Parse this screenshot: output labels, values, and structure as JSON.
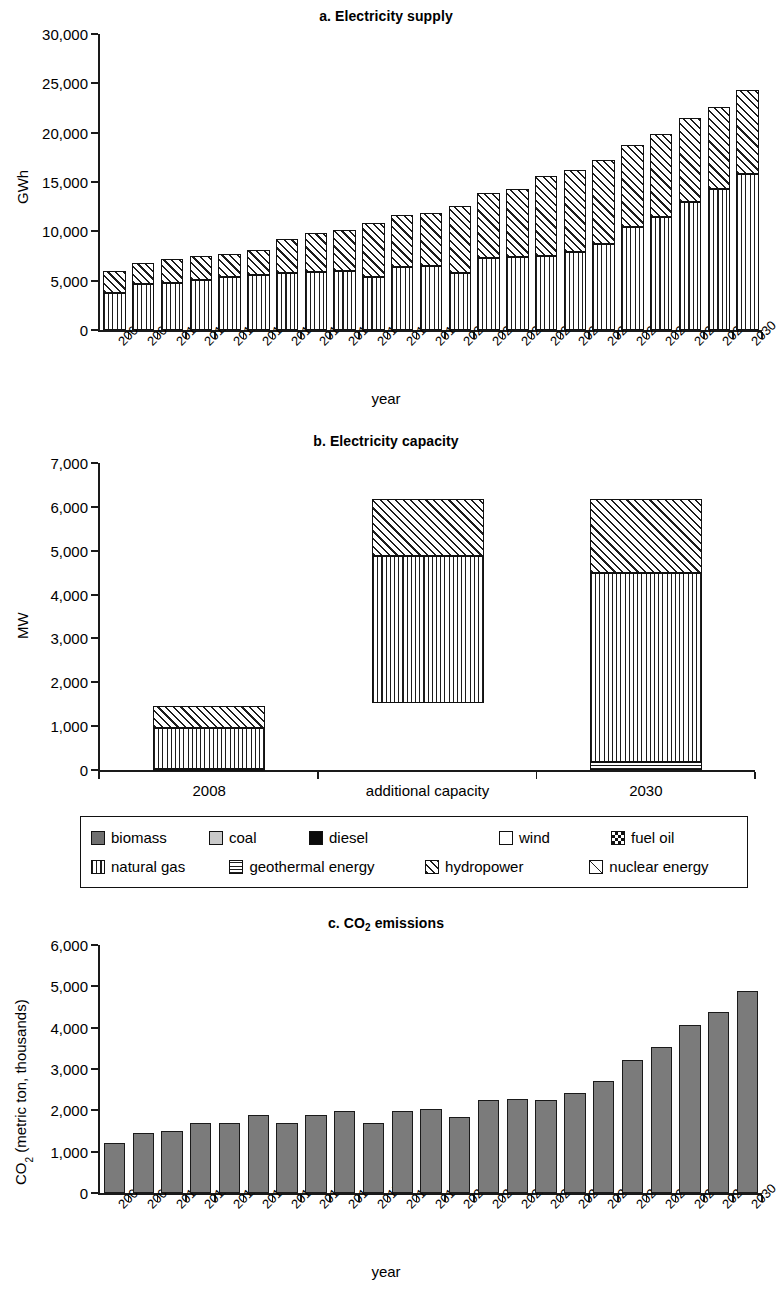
{
  "figure": {
    "axis_x_title": "year",
    "panels": [
      "a. Electricity supply",
      "b. Electricity capacity",
      "c. CO2 emissions"
    ]
  },
  "legend": {
    "rows": [
      [
        {
          "label": "biomass",
          "pattern": "p-biomass",
          "icon": "biomass-swatch"
        },
        {
          "label": "coal",
          "pattern": "p-coal",
          "icon": "coal-swatch"
        },
        {
          "label": "diesel",
          "pattern": "p-diesel",
          "icon": "diesel-swatch"
        },
        {
          "label": "wind",
          "pattern": "p-wind",
          "icon": "wind-swatch"
        },
        {
          "label": "fuel oil",
          "pattern": "p-fueloil",
          "icon": "fuel-oil-swatch"
        }
      ],
      [
        {
          "label": "natural gas",
          "pattern": "p-gas",
          "icon": "natural-gas-swatch"
        },
        {
          "label": "geothermal energy",
          "pattern": "p-geo",
          "icon": "geothermal-energy-swatch"
        },
        {
          "label": "hydropower",
          "pattern": "p-hydro",
          "icon": "hydropower-swatch"
        },
        {
          "label": "nuclear energy",
          "pattern": "p-nuclear",
          "icon": "nuclear-energy-swatch"
        }
      ]
    ]
  },
  "chart_data": [
    {
      "type": "bar",
      "id": "a",
      "title": "a. Electricity supply",
      "stacked": true,
      "xlabel": "year",
      "ylabel": "GWh",
      "ylim": [
        0,
        30000
      ],
      "yticks": [
        0,
        5000,
        10000,
        15000,
        20000,
        25000,
        30000
      ],
      "ytick_labels": [
        "0",
        "5,000",
        "10,000",
        "15,000",
        "20,000",
        "25,000",
        "30,000"
      ],
      "grid": false,
      "legend_position": "below-panel-b",
      "categories": [
        "2008",
        "2009",
        "2010",
        "2011",
        "2012",
        "2013",
        "2014",
        "2015",
        "2016",
        "2017",
        "2018",
        "2019",
        "2020",
        "2021",
        "2022",
        "2023",
        "2024",
        "2025",
        "2026",
        "2027",
        "2028",
        "2029",
        "2030"
      ],
      "series": [
        {
          "name": "natural gas",
          "pattern": "p-gas",
          "values": [
            3700,
            4700,
            4800,
            5100,
            5400,
            5600,
            5800,
            5900,
            6000,
            5400,
            6400,
            6500,
            5800,
            7300,
            7400,
            7500,
            7900,
            8700,
            10400,
            11500,
            13000,
            14300,
            15800
          ]
        },
        {
          "name": "hydropower",
          "pattern": "p-hydro",
          "values": [
            2250,
            2100,
            2350,
            2350,
            2350,
            2550,
            3400,
            3900,
            4150,
            5450,
            5300,
            5400,
            6800,
            6600,
            6900,
            8100,
            8300,
            8500,
            8400,
            8400,
            8500,
            8300,
            8500
          ]
        }
      ],
      "totals": [
        5950,
        6800,
        7150,
        7450,
        7750,
        8150,
        9200,
        9800,
        10150,
        10850,
        11700,
        11900,
        12600,
        13900,
        14300,
        15600,
        16200,
        17200,
        18800,
        19900,
        21500,
        22600,
        24300
      ]
    },
    {
      "type": "bar",
      "id": "b",
      "title": "b. Electricity capacity",
      "stacked": true,
      "xlabel": "",
      "ylabel": "MW",
      "ylim": [
        0,
        7000
      ],
      "yticks": [
        0,
        1000,
        2000,
        3000,
        4000,
        5000,
        6000,
        7000
      ],
      "ytick_labels": [
        "0",
        "1,000",
        "2,000",
        "3,000",
        "4,000",
        "5,000",
        "6,000",
        "7,000"
      ],
      "grid": false,
      "categories": [
        "2008",
        "additional capacity",
        "2030"
      ],
      "series": [
        {
          "name": "geothermal energy",
          "pattern": "p-geo",
          "values": [
            30,
            0,
            175
          ]
        },
        {
          "name": "natural gas",
          "pattern": "p-gas",
          "values": [
            920,
            3350,
            4320
          ]
        },
        {
          "name": "hydropower",
          "pattern": "p-hydro",
          "values": [
            500,
            1300,
            1695
          ]
        }
      ],
      "bar_bases": [
        0,
        1520,
        0
      ],
      "totals": [
        1450,
        6170,
        6190
      ]
    },
    {
      "type": "bar",
      "id": "c",
      "title": "c. CO2 emissions",
      "stacked": false,
      "xlabel": "year",
      "ylabel": "CO2 (metric ton, thousands)",
      "ylim": [
        0,
        6000
      ],
      "yticks": [
        0,
        1000,
        2000,
        3000,
        4000,
        5000,
        6000
      ],
      "ytick_labels": [
        "0",
        "1,000",
        "2,000",
        "3,000",
        "4,000",
        "5,000",
        "6,000"
      ],
      "grid": false,
      "bar_color": "#7b7b7b",
      "categories": [
        "2008",
        "2009",
        "2010",
        "2011",
        "2012",
        "2013",
        "2014",
        "2015",
        "2016",
        "2017",
        "2018",
        "2019",
        "2020",
        "2021",
        "2022",
        "2023",
        "2024",
        "2025",
        "2026",
        "2027",
        "2028",
        "2029",
        "2030"
      ],
      "values": [
        1200,
        1450,
        1510,
        1690,
        1690,
        1880,
        1700,
        1880,
        1990,
        1700,
        1990,
        2040,
        1840,
        2250,
        2270,
        2250,
        2430,
        2700,
        3210,
        3540,
        4060,
        4380,
        4880
      ]
    }
  ]
}
